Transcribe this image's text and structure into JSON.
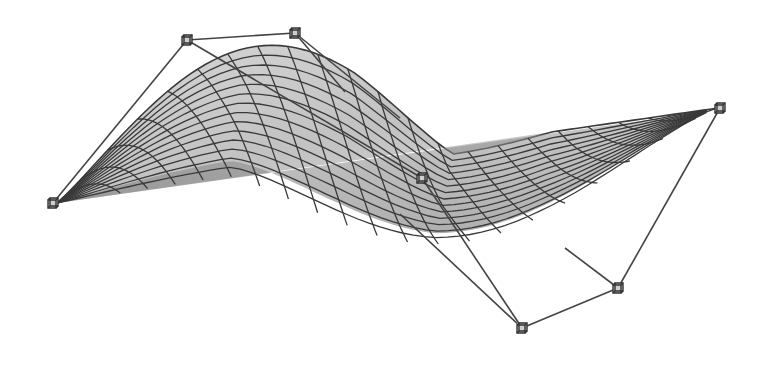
{
  "figure": {
    "title": "Bezier surface with control net",
    "colors": {
      "background": "#ffffff",
      "surface_fill_light": "#d8d8d8",
      "surface_fill_dark": "#8c8c8c",
      "grid_line": "#3a3a3a",
      "control_net_line": "#444444",
      "control_point": "#333333"
    },
    "control_points": [
      {
        "id": "p-left",
        "x": 53,
        "y": 203
      },
      {
        "id": "p-top-left",
        "x": 187,
        "y": 40
      },
      {
        "id": "p-top-middle",
        "x": 295,
        "y": 33
      },
      {
        "id": "p-center",
        "x": 422,
        "y": 178
      },
      {
        "id": "p-right",
        "x": 720,
        "y": 108
      },
      {
        "id": "p-bottom-middle",
        "x": 522,
        "y": 328
      },
      {
        "id": "p-bottom-right",
        "x": 618,
        "y": 288
      }
    ],
    "control_net_edges": [
      [
        53,
        203,
        187,
        40
      ],
      [
        187,
        40,
        295,
        33
      ],
      [
        187,
        40,
        422,
        178
      ],
      [
        295,
        33,
        345,
        92
      ],
      [
        295,
        33,
        400,
        118
      ],
      [
        422,
        178,
        522,
        328
      ],
      [
        400,
        214,
        522,
        328
      ],
      [
        522,
        328,
        618,
        288
      ],
      [
        618,
        288,
        565,
        248
      ],
      [
        618,
        288,
        720,
        108
      ]
    ],
    "surface_grid": {
      "u_lines": 22,
      "v_lines": 14
    }
  }
}
